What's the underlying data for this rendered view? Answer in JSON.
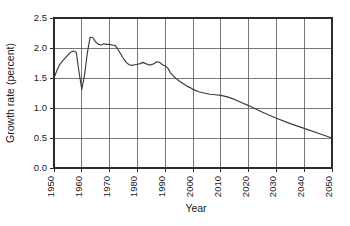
{
  "chart_data": {
    "type": "line",
    "title": "",
    "xlabel": "Year",
    "ylabel": "Growth rate (percent)",
    "xlim": [
      1950,
      2050
    ],
    "ylim": [
      0.0,
      2.5
    ],
    "grid": true,
    "legend": "none",
    "xticks": [
      1950,
      1960,
      1970,
      1980,
      1990,
      2000,
      2010,
      2020,
      2030,
      2040,
      2050
    ],
    "xtick_labels": [
      "1950",
      "1960",
      "1970",
      "1980",
      "1990",
      "2000",
      "2010",
      "2020",
      "2030",
      "2040",
      "2050"
    ],
    "yticks": [
      0.0,
      0.5,
      1.0,
      1.5,
      2.0,
      2.5
    ],
    "ytick_labels": [
      "0.0",
      "0.5",
      "1.0",
      "1.5",
      "2.0",
      "2.5"
    ],
    "series": [
      {
        "name": "World population growth rate",
        "color": "#3a3a3a",
        "x": [
          1950,
          1951,
          1952,
          1953,
          1954,
          1955,
          1956,
          1957,
          1958,
          1959,
          1960,
          1961,
          1962,
          1963,
          1964,
          1965,
          1966,
          1967,
          1968,
          1969,
          1970,
          1971,
          1972,
          1973,
          1974,
          1975,
          1976,
          1977,
          1978,
          1979,
          1980,
          1981,
          1982,
          1983,
          1984,
          1985,
          1986,
          1987,
          1988,
          1989,
          1990,
          1991,
          1992,
          1993,
          1994,
          1995,
          1996,
          1997,
          1998,
          1999,
          2000,
          2002,
          2004,
          2006,
          2008,
          2010,
          2012,
          2014,
          2016,
          2018,
          2020,
          2025,
          2030,
          2035,
          2040,
          2045,
          2050
        ],
        "y": [
          1.5,
          1.62,
          1.72,
          1.78,
          1.83,
          1.88,
          1.93,
          1.95,
          1.93,
          1.6,
          1.31,
          1.55,
          1.92,
          2.18,
          2.17,
          2.1,
          2.06,
          2.05,
          2.07,
          2.06,
          2.06,
          2.05,
          2.04,
          1.98,
          1.9,
          1.82,
          1.76,
          1.72,
          1.71,
          1.72,
          1.73,
          1.74,
          1.76,
          1.74,
          1.72,
          1.72,
          1.74,
          1.77,
          1.76,
          1.72,
          1.7,
          1.66,
          1.58,
          1.53,
          1.49,
          1.45,
          1.42,
          1.39,
          1.36,
          1.34,
          1.31,
          1.27,
          1.25,
          1.23,
          1.22,
          1.21,
          1.19,
          1.16,
          1.12,
          1.08,
          1.04,
          0.93,
          0.83,
          0.74,
          0.66,
          0.58,
          0.5
        ]
      }
    ]
  },
  "axis_title_x": "Year",
  "axis_title_y": "Growth rate (percent)"
}
